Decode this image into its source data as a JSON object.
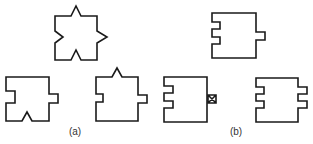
{
  "figure": {
    "stroke_color": "#1a1a1a",
    "panels": [
      {
        "label": "(a)",
        "label_pos": {
          "x": 75,
          "y": 127
        },
        "shapes": [
          {
            "name": "square-spike-top-notch-left-spike-right-notch-bottom",
            "path": "M55,16 L71,16 L76,6 L81,16 L97,16 L97,31 L107,37 L97,43 L97,60 L81,60 L76,50 L71,60 L55,60 L55,43 L63,37 L55,31 Z"
          },
          {
            "name": "square-notch-left-tab-right-notch-bottom",
            "path": "M6,77 L49,77 L49,94 L58,94 L58,103 L49,103 L49,121 L32,121 L27,112 L22,121 L6,121 L6,103 L15,103 L15,91 L6,91 Z"
          },
          {
            "name": "square-spike-top-notch-left-tab-right",
            "path": "M96,77 L112,77 L117,68 L122,77 L138,77 L138,95 L147,95 L147,103 L138,103 L138,121 L96,121 L96,102 L103,102 L103,94 L96,94 Z"
          }
        ]
      },
      {
        "label": "(b)",
        "label_pos": {
          "x": 236,
          "y": 127
        },
        "shapes": [
          {
            "name": "block-serrated-left-tab-right",
            "path": "M212,13 L256,13 L256,32 L265,32 L265,40 L256,40 L256,58 L212,58 L212,44 L220,44 L220,37 L212,37 L212,29 L220,29 L220,22 L212,22 Z"
          },
          {
            "name": "block-serrated-left-crossed-box-right",
            "path": "M164,77 L207,77 L207,122 L164,122 L164,108 L173,108 L173,101 L164,101 L164,93 L173,93 L173,86 L164,86 Z"
          },
          {
            "name": "block-serrated-left-serrated-right",
            "path": "M256,78 L298,78 L298,87 L307,87 L307,94 L298,94 L298,101 L307,101 L307,108 L298,108 L298,122 L256,122 L256,108 L264,108 L264,101 L256,101 L256,94 L264,94 L264,87 L256,87 Z"
          }
        ],
        "crossed_box": {
          "x": 208,
          "y": 95,
          "w": 8,
          "h": 8
        }
      }
    ]
  }
}
